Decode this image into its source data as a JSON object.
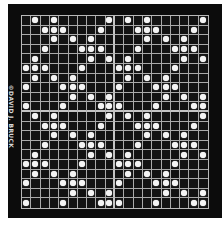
{
  "credit": "©DAVID J. BRUCK",
  "board": {
    "rows": 20,
    "cols": 20,
    "tile_size": 10,
    "tiling": "2x2 repetition of a 10x10 tile",
    "colors": {
      "background": "#0c0c0c",
      "grid_line": "#a9a9a9",
      "peg": "#f4f4f4",
      "page": "#ffffff"
    },
    "tile_rows": [
      [
        1,
        3,
        9
      ],
      [
        2,
        3,
        4,
        8
      ],
      [
        3,
        5,
        7
      ],
      [
        2,
        6,
        7,
        8
      ],
      [
        1,
        7,
        9
      ],
      [
        0,
        1,
        2,
        6
      ],
      [
        1,
        3,
        5
      ],
      [
        0,
        4,
        5,
        6
      ],
      [
        5,
        7,
        9
      ],
      [
        0,
        4,
        8,
        9
      ]
    ]
  }
}
